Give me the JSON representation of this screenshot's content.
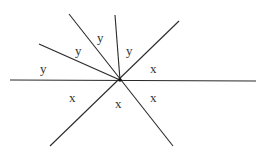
{
  "diagram": {
    "type": "intersecting-lines-angles",
    "center": {
      "x": 120,
      "y": 80
    },
    "line_color": "#2a2a2a",
    "lines": [
      {
        "id": "horizontal",
        "x1": 10,
        "y1": 80,
        "x2": 256,
        "y2": 81
      },
      {
        "id": "diag-steep",
        "x1": 69,
        "y1": 14,
        "x2": 173,
        "y2": 146
      },
      {
        "id": "diag-rising",
        "x1": 50,
        "y1": 146,
        "x2": 179,
        "y2": 21
      },
      {
        "id": "ray-shallow",
        "x1": 39,
        "y1": 44,
        "x2": 120,
        "y2": 80
      },
      {
        "id": "ray-vertical",
        "x1": 115,
        "y1": 15,
        "x2": 120,
        "y2": 80
      }
    ],
    "labels": [
      {
        "text": "y",
        "x": 40,
        "y": 73
      },
      {
        "text": "y",
        "x": 75,
        "y": 55
      },
      {
        "text": "y",
        "x": 97,
        "y": 42
      },
      {
        "text": "y",
        "x": 126,
        "y": 55
      },
      {
        "text": "x",
        "x": 150,
        "y": 73
      },
      {
        "text": "x",
        "x": 69,
        "y": 102
      },
      {
        "text": "x",
        "x": 115,
        "y": 108
      },
      {
        "text": "x",
        "x": 150,
        "y": 102
      }
    ]
  }
}
